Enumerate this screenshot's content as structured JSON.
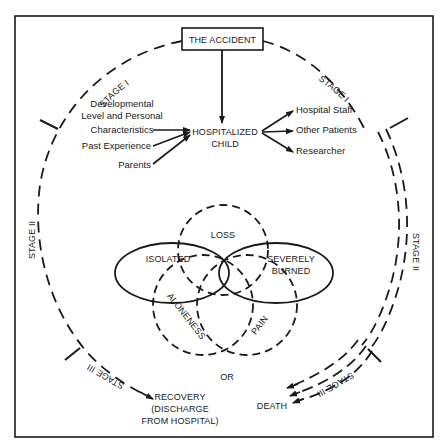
{
  "diagram": {
    "title_box": "THE ACCIDENT",
    "center_node": {
      "line1": "HOSPITALIZED",
      "line2": "CHILD"
    },
    "left_inputs": [
      {
        "lines": [
          "Developmental",
          "Level and Personal",
          "Characteristics"
        ]
      },
      {
        "lines": [
          "Past Experience"
        ]
      },
      {
        "lines": [
          "Parents"
        ]
      }
    ],
    "right_outputs": [
      "Hospital Staff",
      "Other Patients",
      "Researcher"
    ],
    "stage_labels": {
      "stage1_left": "STAGE I",
      "stage1_right": "STAGE I",
      "stage2_left": "STAGE II",
      "stage2_right": "STAGE II",
      "stage3_left": "STAGE III",
      "stage3_right": "STAGE III"
    },
    "venn": {
      "solid": [
        {
          "label": "ISOLATED"
        },
        {
          "label_line1": "SEVERELY",
          "label_line2": "BURNED"
        }
      ],
      "dashed": [
        {
          "label": "LOSS"
        },
        {
          "label": "ALONENESS"
        },
        {
          "label": "PAIN"
        }
      ]
    },
    "outcomes": {
      "connector": "OR",
      "recovery": [
        "RECOVERY",
        "(DISCHARGE",
        "FROM HOSPITAL)"
      ],
      "death": "DEATH"
    },
    "colors": {
      "ink": "#1a1a1a",
      "background": "#ffffff"
    }
  }
}
